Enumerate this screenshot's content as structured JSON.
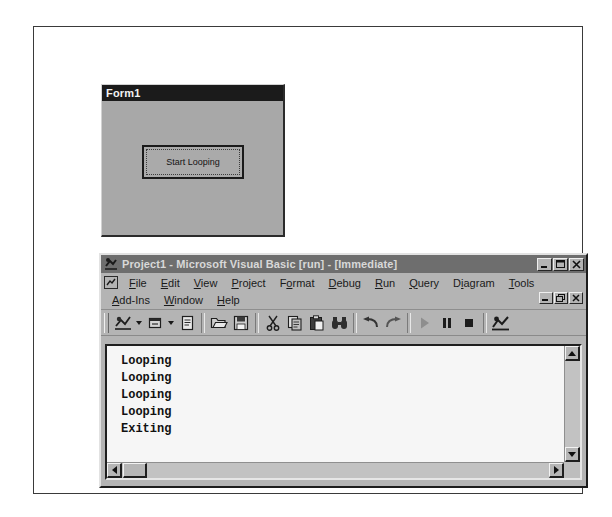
{
  "form_window": {
    "title": "Form1",
    "button_label": "Start Looping",
    "button_name": "start-looping-button"
  },
  "vb_window": {
    "title": "Project1 - Microsoft Visual Basic [run] - [Immediate]",
    "app_icon": "visual-basic-icon",
    "window_buttons": [
      {
        "name": "minimize-button",
        "glyph": "_"
      },
      {
        "name": "maximize-button",
        "glyph": "□"
      },
      {
        "name": "close-button",
        "glyph": "×"
      }
    ],
    "mdi_buttons": [
      {
        "name": "mdi-minimize-button",
        "glyph": "_"
      },
      {
        "name": "mdi-restore-button",
        "glyph": "Ὕ7"
      },
      {
        "name": "mdi-close-button",
        "glyph": "×"
      }
    ],
    "menu_row_1": [
      {
        "name": "menu-file",
        "label": "File",
        "accel": "F"
      },
      {
        "name": "menu-edit",
        "label": "Edit",
        "accel": "E"
      },
      {
        "name": "menu-view",
        "label": "View",
        "accel": "V"
      },
      {
        "name": "menu-project",
        "label": "Project",
        "accel": "P"
      },
      {
        "name": "menu-format",
        "label": "Format",
        "accel": "o"
      },
      {
        "name": "menu-debug",
        "label": "Debug",
        "accel": "D"
      },
      {
        "name": "menu-run",
        "label": "Run",
        "accel": "R"
      },
      {
        "name": "menu-query",
        "label": "Query",
        "accel": "Q"
      },
      {
        "name": "menu-diagram",
        "label": "Diagram",
        "accel": "i"
      },
      {
        "name": "menu-tools",
        "label": "Tools",
        "accel": "T"
      }
    ],
    "menu_row_2": [
      {
        "name": "menu-add-ins",
        "label": "Add-Ins",
        "accel": "A"
      },
      {
        "name": "menu-window",
        "label": "Window",
        "accel": "W"
      },
      {
        "name": "menu-help",
        "label": "Help",
        "accel": "H"
      }
    ],
    "toolbar": [
      {
        "name": "add-project-button",
        "icon": "add-project-icon",
        "dropdown": true
      },
      {
        "name": "add-form-button",
        "icon": "add-form-icon",
        "dropdown": true
      },
      {
        "name": "menu-editor-button",
        "icon": "menu-editor-icon",
        "dropdown": false
      },
      {
        "sep": true
      },
      {
        "name": "open-project-button",
        "icon": "open-folder-icon",
        "dropdown": false
      },
      {
        "name": "save-project-button",
        "icon": "floppy-disk-icon",
        "dropdown": false
      },
      {
        "sep": true
      },
      {
        "name": "cut-button",
        "icon": "scissors-icon",
        "dropdown": false
      },
      {
        "name": "copy-button",
        "icon": "copy-icon",
        "dropdown": false
      },
      {
        "name": "paste-button",
        "icon": "clipboard-paste-icon",
        "dropdown": false
      },
      {
        "name": "find-button",
        "icon": "binoculars-icon",
        "dropdown": false
      },
      {
        "sep": true
      },
      {
        "name": "undo-button",
        "icon": "undo-arrow-icon",
        "dropdown": false
      },
      {
        "name": "redo-button",
        "icon": "redo-arrow-icon",
        "dropdown": false
      },
      {
        "sep": true
      },
      {
        "name": "start-button",
        "icon": "play-triangle-icon",
        "dropdown": false
      },
      {
        "name": "break-button",
        "icon": "pause-bars-icon",
        "dropdown": false
      },
      {
        "name": "end-button",
        "icon": "stop-square-icon",
        "dropdown": false
      },
      {
        "sep": true
      },
      {
        "name": "project-explorer-button",
        "icon": "project-explorer-icon",
        "dropdown": false
      }
    ],
    "immediate": {
      "lines": [
        "Looping",
        "Looping",
        "Looping",
        "Looping",
        "Exiting"
      ],
      "vscroll": {
        "up": "scroll-up-arrow-icon",
        "down": "scroll-down-arrow-icon"
      },
      "hscroll": {
        "left": "scroll-left-arrow-icon",
        "right": "scroll-right-arrow-icon"
      }
    }
  },
  "colors": {
    "page_background": "#ffffff",
    "window_face": "#b4b4b4",
    "form_face": "#a8a8a8",
    "form_titlebar": "#1b1b1b",
    "vb_titlebar": "#6e6e6e",
    "client_area": "#f6f6f6",
    "text": "#111111"
  }
}
